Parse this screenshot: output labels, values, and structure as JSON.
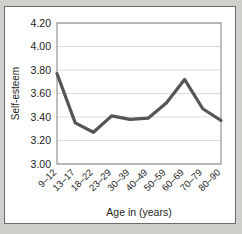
{
  "card": {
    "background_color": "#ffffff",
    "border_color": "#6b6b6b",
    "page_background_color": "#cfcfcb"
  },
  "chart_data": {
    "type": "line",
    "title": "",
    "subtitle": "",
    "xlabel": "Age in (years)",
    "ylabel": "Self-esteem",
    "categories": [
      "9–12",
      "13–17",
      "18–22",
      "23–29",
      "30–39",
      "40–49",
      "50–59",
      "60–69",
      "70–79",
      "80–90"
    ],
    "values": [
      3.77,
      3.35,
      3.27,
      3.41,
      3.38,
      3.39,
      3.52,
      3.72,
      3.47,
      3.37
    ],
    "series": [
      {
        "name": "Self-esteem",
        "values": [
          3.77,
          3.35,
          3.27,
          3.41,
          3.38,
          3.39,
          3.52,
          3.72,
          3.47,
          3.37
        ],
        "color": "#555555"
      }
    ],
    "ylim": [
      3.0,
      4.2
    ],
    "ytick_values": [
      3.0,
      3.2,
      3.4,
      3.6,
      3.8,
      4.0,
      4.2
    ],
    "ytick_labels": [
      "3.00",
      "3.20",
      "3.40",
      "3.60",
      "3.80",
      "4.00",
      "4.20"
    ],
    "grid": true,
    "grid_axis": "y",
    "grid_color": "#d2d2d2",
    "legend": false,
    "legend_position": "none",
    "line_color": "#555555",
    "line_width": 3.2,
    "axis_color": "#8a8a8a",
    "xtick_rotation": -45,
    "markers": false
  }
}
